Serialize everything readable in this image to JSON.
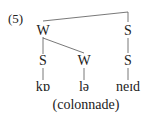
{
  "example_number": "(5)",
  "tree": {
    "root_left": "W",
    "root_right": "S",
    "level2": [
      "S",
      "W",
      "S"
    ],
    "syllables": [
      "kɒ",
      "lə",
      "neɪd"
    ]
  },
  "word": "(colonnade)"
}
